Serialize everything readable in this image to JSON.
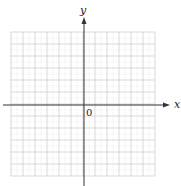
{
  "figure": {
    "x_axis_label": "x",
    "y_axis_label": "y",
    "origin_label": "0",
    "grid": {
      "columns": 12,
      "rows": 12,
      "cell_px": 12,
      "left": 11,
      "top": 32,
      "minor_dotted": true,
      "major_color": "#cfcfcf",
      "minor_color": "#dedede"
    },
    "axes": {
      "color": "#333333",
      "x_axis_y": 105,
      "x_axis_from": 3,
      "x_axis_to": 170,
      "y_axis_x": 84,
      "y_axis_from": 186,
      "y_axis_to": 17
    }
  }
}
